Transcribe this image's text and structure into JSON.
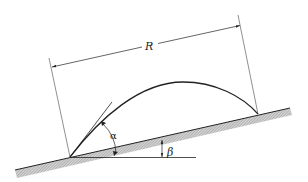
{
  "diagram": {
    "type": "projectile-on-incline",
    "labels": {
      "range": "R",
      "launch_angle": "α",
      "incline_angle": "β"
    },
    "colors": {
      "line": "#222222",
      "hatch": "#9a9a9a",
      "background": "#ffffff"
    }
  }
}
